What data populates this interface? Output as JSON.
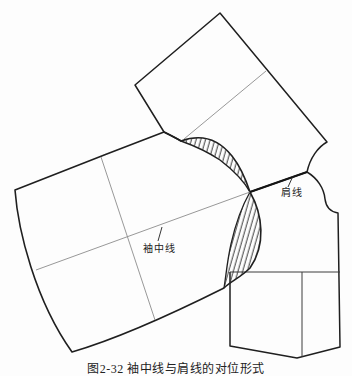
{
  "figure": {
    "type": "garment-pattern-diagram",
    "caption": "图2-32 袖中线与肩线的对位形式",
    "labels": {
      "sleeve_center_line": "袖中线",
      "shoulder_line": "肩线"
    },
    "pieces": [
      "back-bodice-piece",
      "front-bodice-piece",
      "sleeve-piece"
    ],
    "hatched_regions": [
      "upper-overlap-crescent",
      "lower-overlap-crescent"
    ],
    "colors": {
      "background": "#fdfdfd",
      "outline": "#1f1f1f",
      "thin_line": "#8c8c8c",
      "internal_line": "#3d3d3d",
      "hatch": "#2b2b2b"
    }
  }
}
